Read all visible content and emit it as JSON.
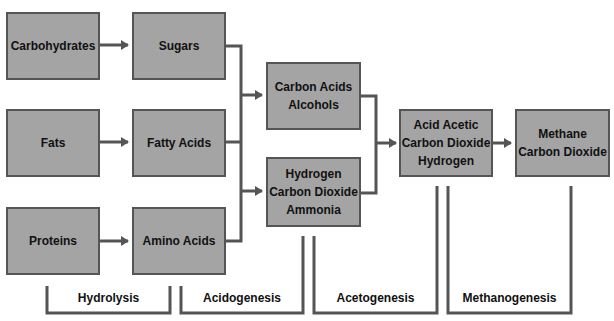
{
  "nodes": {
    "carbohydrates": [
      "Carbohydrates"
    ],
    "fats": [
      "Fats"
    ],
    "proteins": [
      "Proteins"
    ],
    "sugars": [
      "Sugars"
    ],
    "fatty_acids": [
      "Fatty Acids"
    ],
    "amino_acids": [
      "Amino Acids"
    ],
    "carbon_acids": [
      "Carbon Acids",
      "Alcohols"
    ],
    "hydrogen": [
      "Hydrogen",
      "Carbon Dioxide",
      "Ammonia"
    ],
    "acid_acetic": [
      "Acid Acetic",
      "Carbon Dioxide",
      "Hydrogen"
    ],
    "methane": [
      "Methane",
      "Carbon Dioxide"
    ]
  },
  "stages": {
    "hydrolysis": "Hydrolysis",
    "acidogenesis": "Acidogenesis",
    "acetogenesis": "Acetogenesis",
    "methanogenesis": "Methanogenesis"
  },
  "colors": {
    "box_fill": "#a4a4a4",
    "line": "#555555"
  }
}
